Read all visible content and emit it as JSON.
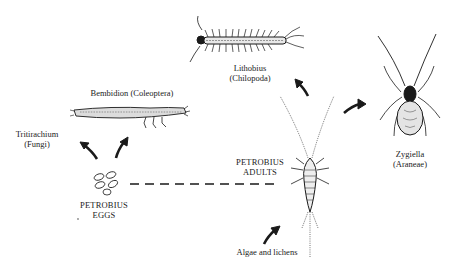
{
  "diagram": {
    "type": "food-web",
    "nodes": {
      "lithobius": {
        "name": "Lithobius",
        "group": "(Chilopoda)"
      },
      "bembidion": {
        "label": "Bembidion (Coleoptera)"
      },
      "tritirachium": {
        "name": "Tritirachium",
        "group": "(Fungi)"
      },
      "zygiella": {
        "name": "Zygiella",
        "group": "(Araneae)"
      },
      "petrobius_adults": {
        "line1": "PETROBIUS",
        "line2": "ADULTS"
      },
      "petrobius_eggs": {
        "line1": "PETROBIUS",
        "line2": "EGGS"
      },
      "algae": {
        "label": "Algae and lichens"
      }
    },
    "links": [
      {
        "from": "petrobius_eggs",
        "to": "tritirachium",
        "style": "arrow"
      },
      {
        "from": "petrobius_eggs",
        "to": "bembidion",
        "style": "arrow"
      },
      {
        "from": "petrobius_adults",
        "to": "lithobius",
        "style": "arrow"
      },
      {
        "from": "petrobius_adults",
        "to": "zygiella",
        "style": "arrow"
      },
      {
        "from": "algae",
        "to": "petrobius_adults",
        "style": "arrow"
      },
      {
        "from": "petrobius_eggs",
        "to": "petrobius_adults",
        "style": "dashed"
      }
    ],
    "colors": {
      "ink": "#1a1a1a",
      "background": "#ffffff"
    }
  }
}
